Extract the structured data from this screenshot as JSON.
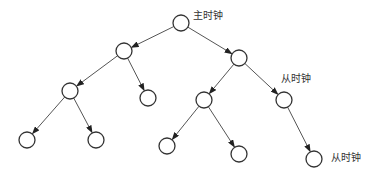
{
  "diagram": {
    "type": "tree",
    "colors": {
      "line": "#555555",
      "node_stroke": "#333333",
      "node_fill": "#ffffff",
      "label": "#333333"
    },
    "node_radius": 8,
    "nodes": [
      {
        "id": "n0",
        "x": 181,
        "y": 23
      },
      {
        "id": "n1",
        "x": 124,
        "y": 51
      },
      {
        "id": "n2",
        "x": 239,
        "y": 58
      },
      {
        "id": "n3",
        "x": 70,
        "y": 91
      },
      {
        "id": "n4",
        "x": 148,
        "y": 98
      },
      {
        "id": "n5",
        "x": 204,
        "y": 100
      },
      {
        "id": "n6",
        "x": 284,
        "y": 100
      },
      {
        "id": "n7",
        "x": 27,
        "y": 140
      },
      {
        "id": "n8",
        "x": 96,
        "y": 140
      },
      {
        "id": "n9",
        "x": 167,
        "y": 146
      },
      {
        "id": "n10",
        "x": 239,
        "y": 154
      },
      {
        "id": "n11",
        "x": 314,
        "y": 159
      }
    ],
    "edges": [
      [
        "n0",
        "n1"
      ],
      [
        "n0",
        "n2"
      ],
      [
        "n1",
        "n3"
      ],
      [
        "n1",
        "n4"
      ],
      [
        "n2",
        "n5"
      ],
      [
        "n2",
        "n6"
      ],
      [
        "n3",
        "n7"
      ],
      [
        "n3",
        "n8"
      ],
      [
        "n5",
        "n9"
      ],
      [
        "n5",
        "n10"
      ],
      [
        "n6",
        "n11"
      ]
    ],
    "labels": [
      {
        "text": "主时钟",
        "x": 193,
        "y": 10,
        "node": "n0"
      },
      {
        "text": "从时钟",
        "x": 281,
        "y": 73,
        "node": "n6"
      },
      {
        "text": "从时钟",
        "x": 331,
        "y": 152,
        "node": "n11"
      }
    ]
  }
}
